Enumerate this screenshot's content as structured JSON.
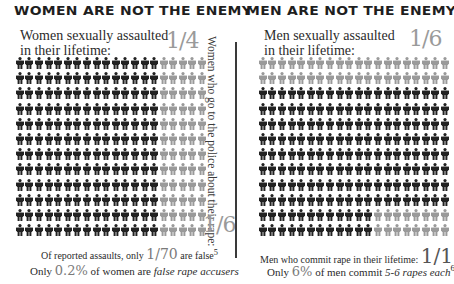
{
  "left": {
    "title": "WOMEN ARE NOT THE ENEMY",
    "subtitle": "Women sexually assaulted in their lifetime:",
    "fraction": "1/4",
    "vertical_label": "Women who go to the police about their rape:",
    "police_fraction": "1/6",
    "footnote1": {
      "prefix": "Of reported assaults, only ",
      "value": "1/70",
      "suffix": " are false",
      "sup": "5"
    },
    "footnote2": {
      "prefix": "Only ",
      "value": "0.2%",
      "middle": " of women are ",
      "emph": "false rape accusers"
    },
    "grid": {
      "rows": 12,
      "cols": 20,
      "dark_cols_per_row": 15,
      "gray_cols_per_row": 5
    }
  },
  "right": {
    "title": "MEN ARE NOT THE ENEMY",
    "subtitle": "Men sexually assaulted in their lifetime:",
    "fraction": "1/6",
    "footnote1": {
      "prefix": "Men who commit rape in their lifetime: ",
      "value": "1/17"
    },
    "footnote2": {
      "prefix": "Only ",
      "value": "6%",
      "middle": " of men commit ",
      "emph_plain": "5-6 ",
      "emph": "rapes each",
      "sup": "6"
    },
    "grid": {
      "rows": 12,
      "cols": 20,
      "row_pattern": [
        {
          "dark": 0,
          "gray": 20
        },
        {
          "dark": 0,
          "gray": 20
        },
        {
          "dark": 20,
          "gray": 0
        },
        {
          "dark": 20,
          "gray": 0
        },
        {
          "dark": 20,
          "gray": 0
        },
        {
          "dark": 20,
          "gray": 0
        },
        {
          "dark": 20,
          "gray": 0
        },
        {
          "dark": 20,
          "gray": 0
        },
        {
          "dark": 20,
          "gray": 0
        },
        {
          "dark": 20,
          "gray": 0
        },
        {
          "dark": 12,
          "gray": 8
        },
        {
          "dark": 12,
          "gray": 8
        }
      ]
    }
  },
  "colors": {
    "dark": "#222222",
    "gray": "#9a9a9a",
    "text": "#2b2b2b"
  },
  "icon": "person-icon"
}
